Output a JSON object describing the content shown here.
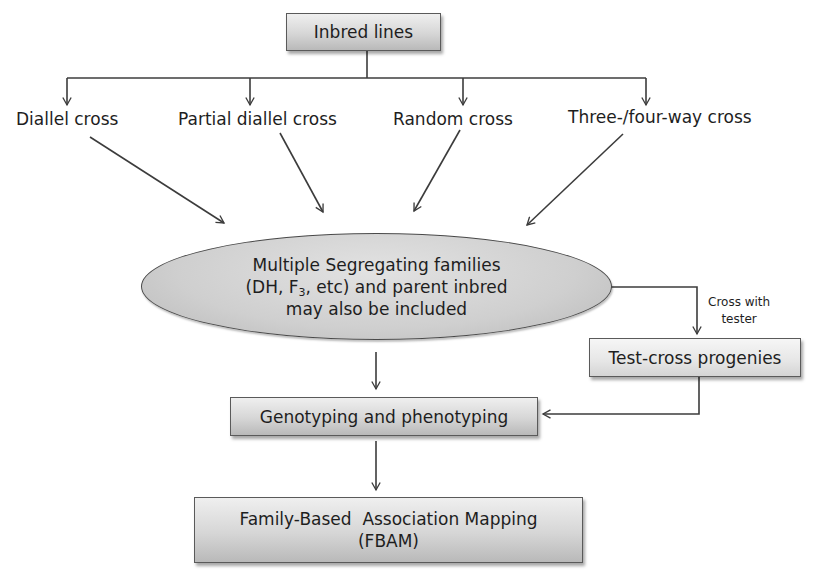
{
  "diagram": {
    "type": "flowchart",
    "top_node": {
      "label": "Inbred lines"
    },
    "cross_types": [
      {
        "label": "Diallel cross"
      },
      {
        "label": "Partial diallel cross"
      },
      {
        "label": "Random cross"
      },
      {
        "label": "Three-/four-way cross"
      }
    ],
    "central_node": {
      "line1": "Multiple Segregating families",
      "line2_prefix": "(DH, F",
      "line2_sub": "3",
      "line2_suffix": ", etc) and parent inbred",
      "line3": "may also be included"
    },
    "side_edge_label": {
      "line1": "Cross with",
      "line2": "tester"
    },
    "test_cross_node": {
      "label": "Test-cross progenies"
    },
    "genotyping_node": {
      "label": "Genotyping and phenotyping"
    },
    "final_node": {
      "line1": "Family-Based  Association Mapping",
      "line2": "(FBAM)"
    },
    "edges": [
      {
        "from": "Inbred lines",
        "to": "Diallel cross"
      },
      {
        "from": "Inbred lines",
        "to": "Partial diallel cross"
      },
      {
        "from": "Inbred lines",
        "to": "Random cross"
      },
      {
        "from": "Inbred lines",
        "to": "Three-/four-way cross"
      },
      {
        "from": "Diallel cross",
        "to": "Multiple Segregating families"
      },
      {
        "from": "Partial diallel cross",
        "to": "Multiple Segregating families"
      },
      {
        "from": "Random cross",
        "to": "Multiple Segregating families"
      },
      {
        "from": "Three-/four-way cross",
        "to": "Multiple Segregating families"
      },
      {
        "from": "Multiple Segregating families",
        "to": "Test-cross progenies",
        "label": "Cross with tester"
      },
      {
        "from": "Multiple Segregating families",
        "to": "Genotyping and phenotyping"
      },
      {
        "from": "Test-cross progenies",
        "to": "Genotyping and phenotyping"
      },
      {
        "from": "Genotyping and phenotyping",
        "to": "Family-Based Association Mapping (FBAM)"
      }
    ],
    "colors": {
      "line": "#3c3c3c",
      "box_fill": "#d0d0d0",
      "text": "#1e1e1e"
    }
  }
}
